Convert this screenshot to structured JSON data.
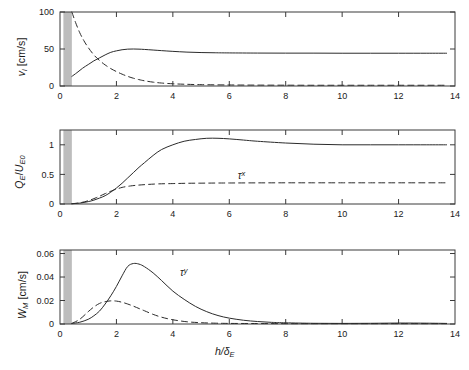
{
  "figure": {
    "background": "#ffffff",
    "axis_color": "#3a3a3a",
    "curve_color": "#2b2b2b",
    "band_color": "#bdbdbd",
    "xlabel": "h/δ",
    "xlabel_sub": "E"
  },
  "chart_data": [
    {
      "type": "line",
      "panel": 1,
      "title": "",
      "xlabel": "h/δ_E",
      "ylabel": "v_l [cm/s]",
      "ylabel_main": "v",
      "ylabel_sub": "l",
      "ylabel_unit": " [cm/s]",
      "xlim": [
        0,
        14
      ],
      "ylim": [
        0,
        100
      ],
      "xticks": [
        0,
        2,
        4,
        6,
        8,
        10,
        12,
        14
      ],
      "xticklabels": [
        "0",
        "2",
        "4",
        "6",
        "8",
        "10",
        "12",
        "14"
      ],
      "yticks": [
        0,
        50,
        100
      ],
      "yticklabels": [
        "0",
        "50",
        "100"
      ],
      "grid": false,
      "shaded_band_x": [
        0.12,
        0.42
      ],
      "series": [
        {
          "name": "solid",
          "style": "solid",
          "x": [
            0.42,
            0.6,
            0.8,
            1.0,
            1.2,
            1.4,
            1.6,
            1.8,
            2.0,
            2.2,
            2.4,
            2.6,
            2.8,
            3.0,
            3.3,
            3.6,
            4.0,
            4.5,
            5.0,
            5.5,
            6.0,
            7.0,
            8.0,
            9.0,
            10.0,
            11.0,
            12.0,
            13.0,
            13.7
          ],
          "y": [
            13,
            18,
            24,
            29,
            34,
            38,
            42,
            45.5,
            47.5,
            49,
            49.8,
            50,
            49.8,
            49.4,
            48.6,
            47.8,
            46.8,
            45.8,
            45.2,
            44.9,
            44.7,
            44.5,
            44.4,
            44.4,
            44.3,
            44.3,
            44.3,
            44.3,
            44.3
          ]
        },
        {
          "name": "dashed",
          "style": "dashed",
          "x": [
            0.42,
            0.55,
            0.7,
            0.85,
            1.0,
            1.2,
            1.4,
            1.6,
            1.8,
            2.0,
            2.2,
            2.4,
            2.6,
            2.8,
            3.0,
            3.3,
            3.6,
            4.0,
            4.4,
            5.0,
            6.0,
            7.0,
            8.0,
            9.0,
            10.0,
            11.0,
            12.0,
            13.0,
            13.7
          ],
          "y": [
            100,
            86,
            72,
            61,
            52,
            42,
            34.5,
            28.5,
            23.5,
            19.5,
            16,
            13,
            10.5,
            8.6,
            7.0,
            5.2,
            4.0,
            3.0,
            2.4,
            1.8,
            1.4,
            1.2,
            1.1,
            1.0,
            1.0,
            1.0,
            1.0,
            1.0,
            1.0
          ]
        }
      ],
      "annotations": []
    },
    {
      "type": "line",
      "panel": 2,
      "title": "",
      "xlabel": "h/δ_E",
      "ylabel": "Q_E/U_E0",
      "ylabel_main": "Q",
      "ylabel_sub": "E",
      "ylabel_main2": "U",
      "ylabel_sub2": "E0",
      "xlim": [
        0,
        14
      ],
      "ylim": [
        0,
        1.25
      ],
      "xticks": [
        0,
        2,
        4,
        6,
        8,
        10,
        12,
        14
      ],
      "xticklabels": [
        "0",
        "2",
        "4",
        "6",
        "8",
        "10",
        "12",
        "14"
      ],
      "yticks": [
        0,
        0.5,
        1
      ],
      "yticklabels": [
        "0",
        "0.5",
        "1"
      ],
      "grid": false,
      "shaded_band_x": [
        0.12,
        0.42
      ],
      "series": [
        {
          "name": "solid",
          "style": "solid",
          "x": [
            0.42,
            0.7,
            1.0,
            1.2,
            1.4,
            1.6,
            1.8,
            2.0,
            2.2,
            2.4,
            2.6,
            2.8,
            3.0,
            3.3,
            3.6,
            4.0,
            4.4,
            4.8,
            5.2,
            5.6,
            6.0,
            6.5,
            7.0,
            8.0,
            9.0,
            10.0,
            11.0,
            12.0,
            13.0,
            13.7
          ],
          "y": [
            0.005,
            0.015,
            0.04,
            0.065,
            0.1,
            0.14,
            0.2,
            0.27,
            0.35,
            0.44,
            0.53,
            0.62,
            0.7,
            0.82,
            0.92,
            1.0,
            1.06,
            1.09,
            1.11,
            1.11,
            1.1,
            1.08,
            1.06,
            1.03,
            1.01,
            1.0,
            1.0,
            1.0,
            1.0,
            1.0
          ]
        },
        {
          "name": "dashed",
          "style": "dashed",
          "x": [
            0.42,
            0.7,
            1.0,
            1.3,
            1.6,
            1.9,
            2.2,
            2.5,
            2.8,
            3.1,
            3.5,
            4.0,
            4.5,
            5.0,
            5.5,
            6.0,
            7.0,
            8.0,
            9.0,
            10.0,
            11.0,
            12.0,
            13.0,
            13.7
          ],
          "y": [
            0.005,
            0.02,
            0.055,
            0.11,
            0.175,
            0.235,
            0.28,
            0.305,
            0.32,
            0.33,
            0.34,
            0.345,
            0.35,
            0.352,
            0.354,
            0.355,
            0.357,
            0.358,
            0.358,
            0.358,
            0.358,
            0.358,
            0.358,
            0.358
          ]
        }
      ],
      "annotations": [
        {
          "text": "τ",
          "sup": "x",
          "x": 6.3,
          "y": 0.47
        }
      ]
    },
    {
      "type": "line",
      "panel": 3,
      "title": "",
      "xlabel": "h/δ_E",
      "ylabel": "W_M [cm/s]",
      "ylabel_main": "W",
      "ylabel_sub": "M",
      "ylabel_unit": " [cm/s]",
      "xlim": [
        0,
        14
      ],
      "ylim": [
        0,
        0.063
      ],
      "xticks": [
        0,
        2,
        4,
        6,
        8,
        10,
        12,
        14
      ],
      "xticklabels": [
        "0",
        "2",
        "4",
        "6",
        "8",
        "10",
        "12",
        "14"
      ],
      "yticks": [
        0,
        0.02,
        0.04,
        0.06
      ],
      "yticklabels": [
        "0",
        "0.02",
        "0.04",
        "0.06"
      ],
      "grid": false,
      "shaded_band_x": [
        0.12,
        0.42
      ],
      "series": [
        {
          "name": "solid",
          "style": "solid",
          "x": [
            0.42,
            0.7,
            1.0,
            1.2,
            1.4,
            1.6,
            1.8,
            2.0,
            2.2,
            2.4,
            2.6,
            2.8,
            3.0,
            3.3,
            3.6,
            4.0,
            4.4,
            4.8,
            5.2,
            5.6,
            6.0,
            6.5,
            7.0,
            7.5,
            8.0,
            9.0,
            10.0,
            11.0,
            12.0,
            13.0,
            13.7
          ],
          "y": [
            0.0005,
            0.0015,
            0.004,
            0.007,
            0.011,
            0.017,
            0.024,
            0.032,
            0.041,
            0.049,
            0.0515,
            0.051,
            0.0487,
            0.0435,
            0.037,
            0.028,
            0.021,
            0.015,
            0.0105,
            0.0072,
            0.005,
            0.0032,
            0.0021,
            0.0014,
            0.001,
            0.0006,
            0.0005,
            0.0006,
            0.0008,
            0.0007,
            0.0005
          ]
        },
        {
          "name": "dashed",
          "style": "dashed",
          "x": [
            0.42,
            0.7,
            1.0,
            1.2,
            1.4,
            1.6,
            1.8,
            2.0,
            2.2,
            2.4,
            2.6,
            2.8,
            3.0,
            3.3,
            3.6,
            4.0,
            4.5,
            5.0,
            5.5,
            6.0,
            7.0,
            8.0,
            9.0,
            10.0,
            11.0,
            12.0,
            13.0,
            13.7
          ],
          "y": [
            0.0005,
            0.004,
            0.0105,
            0.0145,
            0.0175,
            0.019,
            0.0197,
            0.0195,
            0.0185,
            0.017,
            0.0152,
            0.0132,
            0.0112,
            0.0082,
            0.0058,
            0.0036,
            0.0019,
            0.0011,
            0.0007,
            0.0005,
            0.0004,
            0.0003,
            0.0003,
            0.0003,
            0.0003,
            0.0003,
            0.0003,
            0.0003
          ]
        }
      ],
      "annotations": [
        {
          "text": "τ",
          "sup": "y",
          "x": 4.25,
          "y": 0.0435
        }
      ]
    }
  ]
}
